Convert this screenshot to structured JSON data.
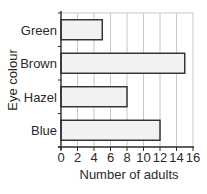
{
  "chart_data": {
    "type": "bar",
    "orientation": "horizontal",
    "title": "",
    "categories": [
      "Green",
      "Brown",
      "Hazel",
      "Blue"
    ],
    "values": [
      5,
      15,
      8,
      12
    ],
    "xlabel": "Number of adults",
    "ylabel": "Eye colour",
    "xlim": [
      0,
      16
    ],
    "xticks": [
      0,
      2,
      4,
      6,
      8,
      10,
      12,
      14,
      16
    ],
    "grid": true,
    "legend": null,
    "colors": {
      "bar_fill": "#f2f2f2",
      "bar_stroke": "#2a2a2a",
      "grid": "#c8c8c8",
      "axis": "#2a2a2a"
    }
  }
}
